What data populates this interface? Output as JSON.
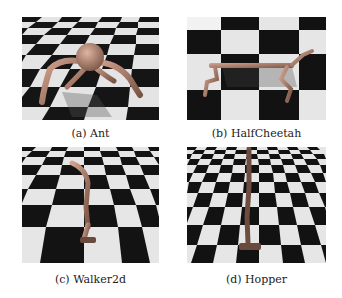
{
  "figure": {
    "panels": [
      {
        "id": "a",
        "label": "(a) Ant",
        "environment": "Ant"
      },
      {
        "id": "b",
        "label": "(b) HalfCheetah",
        "environment": "HalfCheetah"
      },
      {
        "id": "c",
        "label": "(c) Walker2d",
        "environment": "Walker2d"
      },
      {
        "id": "d",
        "label": "(d) Hopper",
        "environment": "Hopper"
      }
    ],
    "colors": {
      "checker_dark": "#111111",
      "checker_light": "#e6e6e6",
      "robot": "#b08070"
    }
  }
}
